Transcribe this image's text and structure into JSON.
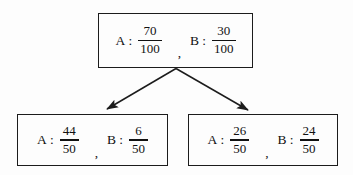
{
  "diagram": {
    "type": "tree-diagram",
    "background_color": "#fdfdfd",
    "line_color": "#1c1c1c",
    "text_color": "#111111",
    "nodes": [
      {
        "id": "top",
        "position": "top-center",
        "terms": [
          {
            "label": "A",
            "colon": ":",
            "numerator": "70",
            "denominator": "100"
          },
          {
            "label": "B",
            "colon": ":",
            "numerator": "30",
            "denominator": "100"
          }
        ],
        "separator": ","
      },
      {
        "id": "left",
        "position": "bottom-left",
        "terms": [
          {
            "label": "A",
            "colon": ":",
            "numerator": "44",
            "denominator": "50"
          },
          {
            "label": "B",
            "colon": ":",
            "numerator": "6",
            "denominator": "50"
          }
        ],
        "separator": ","
      },
      {
        "id": "right",
        "position": "bottom-right",
        "terms": [
          {
            "label": "A",
            "colon": ":",
            "numerator": "26",
            "denominator": "50"
          },
          {
            "label": "B",
            "colon": ":",
            "numerator": "24",
            "denominator": "50"
          }
        ],
        "separator": ","
      }
    ],
    "edges": [
      {
        "from": "top",
        "to": "left",
        "style": "solid-arrow"
      },
      {
        "from": "top",
        "to": "right",
        "style": "solid-arrow"
      }
    ]
  }
}
